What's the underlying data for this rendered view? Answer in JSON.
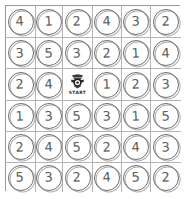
{
  "board": {
    "title": "Number Token Board",
    "columns": 6,
    "rows": 6,
    "grid_color": "#b4b4b4",
    "token_color": "#6e6e6e",
    "digit_color": "#5d5d5d",
    "background": "#ffffff",
    "cells": [
      [
        {
          "type": "number",
          "value": "4"
        },
        {
          "type": "number",
          "value": "1"
        },
        {
          "type": "number",
          "value": "2"
        },
        {
          "type": "number",
          "value": "4"
        },
        {
          "type": "number",
          "value": "3"
        },
        {
          "type": "number",
          "value": "2"
        }
      ],
      [
        {
          "type": "number",
          "value": "3"
        },
        {
          "type": "number",
          "value": "5"
        },
        {
          "type": "number",
          "value": "3"
        },
        {
          "type": "number",
          "value": "2"
        },
        {
          "type": "number",
          "value": "1"
        },
        {
          "type": "number",
          "value": "4"
        }
      ],
      [
        {
          "type": "number",
          "value": "2"
        },
        {
          "type": "number",
          "value": "4"
        },
        {
          "type": "start",
          "value": "START",
          "icon": "crest-icon"
        },
        {
          "type": "number",
          "value": "1"
        },
        {
          "type": "number",
          "value": "2"
        },
        {
          "type": "number",
          "value": "3"
        }
      ],
      [
        {
          "type": "number",
          "value": "1"
        },
        {
          "type": "number",
          "value": "3"
        },
        {
          "type": "number",
          "value": "5"
        },
        {
          "type": "number",
          "value": "3"
        },
        {
          "type": "number",
          "value": "1"
        },
        {
          "type": "number",
          "value": "5"
        }
      ],
      [
        {
          "type": "number",
          "value": "2"
        },
        {
          "type": "number",
          "value": "4"
        },
        {
          "type": "number",
          "value": "5"
        },
        {
          "type": "number",
          "value": "2"
        },
        {
          "type": "number",
          "value": "4"
        },
        {
          "type": "number",
          "value": "3"
        }
      ],
      [
        {
          "type": "number",
          "value": "5"
        },
        {
          "type": "number",
          "value": "3"
        },
        {
          "type": "number",
          "value": "2"
        },
        {
          "type": "number",
          "value": "4"
        },
        {
          "type": "number",
          "value": "5"
        },
        {
          "type": "number",
          "value": "2"
        }
      ]
    ]
  }
}
